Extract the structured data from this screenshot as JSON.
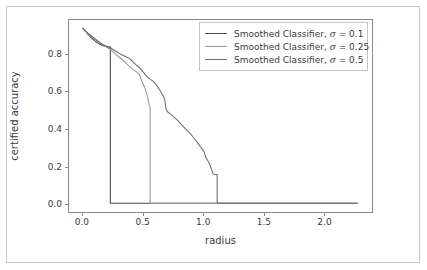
{
  "chart_data": {
    "type": "line",
    "title": "",
    "xlabel": "radius",
    "ylabel": "certified accuracy",
    "xlim": [
      -0.115,
      2.4
    ],
    "ylim": [
      -0.047,
      0.985
    ],
    "xticks": [
      0.0,
      0.5,
      1.0,
      1.5,
      2.0
    ],
    "xticklabels": [
      "0.0",
      "0.5",
      "1.0",
      "1.5",
      "2.0"
    ],
    "yticks": [
      0.0,
      0.2,
      0.4,
      0.6,
      0.8
    ],
    "yticklabels": [
      "0.0",
      "0.2",
      "0.4",
      "0.6",
      "0.8"
    ],
    "grid": false,
    "legend_position": "upper right",
    "series": [
      {
        "name": "Smoothed Classifier, σ = 0.1",
        "label_prefix": "Smoothed Classifier, ",
        "sigma_symbol": "σ",
        "sigma_value": " = 0.1",
        "color": "#4a4a4a",
        "points": [
          [
            0.0,
            0.942
          ],
          [
            0.01,
            0.932
          ],
          [
            0.02,
            0.925
          ],
          [
            0.03,
            0.918
          ],
          [
            0.04,
            0.91
          ],
          [
            0.05,
            0.902
          ],
          [
            0.06,
            0.897
          ],
          [
            0.07,
            0.89
          ],
          [
            0.08,
            0.884
          ],
          [
            0.09,
            0.879
          ],
          [
            0.1,
            0.873
          ],
          [
            0.11,
            0.868
          ],
          [
            0.12,
            0.863
          ],
          [
            0.13,
            0.859
          ],
          [
            0.14,
            0.856
          ],
          [
            0.15,
            0.852
          ],
          [
            0.16,
            0.849
          ],
          [
            0.17,
            0.847
          ],
          [
            0.18,
            0.845
          ],
          [
            0.19,
            0.843
          ],
          [
            0.2,
            0.842
          ],
          [
            0.21,
            0.841
          ],
          [
            0.22,
            0.84
          ],
          [
            0.228,
            0.84
          ],
          [
            0.228,
            0.0
          ],
          [
            2.28,
            0.0
          ]
        ]
      },
      {
        "name": "Smoothed Classifier, σ = 0.25",
        "label_prefix": "Smoothed Classifier, ",
        "sigma_symbol": "σ",
        "sigma_value": " = 0.25",
        "color": "#9a9a9a",
        "points": [
          [
            0.0,
            0.942
          ],
          [
            0.015,
            0.93
          ],
          [
            0.03,
            0.92
          ],
          [
            0.045,
            0.911
          ],
          [
            0.06,
            0.903
          ],
          [
            0.075,
            0.896
          ],
          [
            0.09,
            0.889
          ],
          [
            0.105,
            0.881
          ],
          [
            0.12,
            0.874
          ],
          [
            0.135,
            0.866
          ],
          [
            0.15,
            0.859
          ],
          [
            0.165,
            0.852
          ],
          [
            0.18,
            0.846
          ],
          [
            0.195,
            0.84
          ],
          [
            0.21,
            0.834
          ],
          [
            0.225,
            0.828
          ],
          [
            0.24,
            0.82
          ],
          [
            0.255,
            0.812
          ],
          [
            0.27,
            0.803
          ],
          [
            0.285,
            0.794
          ],
          [
            0.3,
            0.786
          ],
          [
            0.315,
            0.778
          ],
          [
            0.33,
            0.77
          ],
          [
            0.345,
            0.762
          ],
          [
            0.36,
            0.752
          ],
          [
            0.375,
            0.742
          ],
          [
            0.39,
            0.734
          ],
          [
            0.405,
            0.726
          ],
          [
            0.42,
            0.718
          ],
          [
            0.435,
            0.71
          ],
          [
            0.45,
            0.702
          ],
          [
            0.46,
            0.697
          ],
          [
            0.47,
            0.692
          ],
          [
            0.48,
            0.672
          ],
          [
            0.49,
            0.655
          ],
          [
            0.5,
            0.641
          ],
          [
            0.51,
            0.628
          ],
          [
            0.52,
            0.61
          ],
          [
            0.53,
            0.588
          ],
          [
            0.54,
            0.562
          ],
          [
            0.55,
            0.53
          ],
          [
            0.558,
            0.518
          ],
          [
            0.558,
            0.0
          ],
          [
            2.28,
            0.0
          ]
        ]
      },
      {
        "name": "Smoothed Classifier, σ = 0.5",
        "label_prefix": "Smoothed Classifier, ",
        "sigma_symbol": "σ",
        "sigma_value": " = 0.5",
        "color": "#6f6f6f",
        "points": [
          [
            0.0,
            0.942
          ],
          [
            0.02,
            0.928
          ],
          [
            0.04,
            0.916
          ],
          [
            0.06,
            0.905
          ],
          [
            0.08,
            0.895
          ],
          [
            0.1,
            0.884
          ],
          [
            0.12,
            0.874
          ],
          [
            0.14,
            0.864
          ],
          [
            0.16,
            0.856
          ],
          [
            0.18,
            0.849
          ],
          [
            0.2,
            0.843
          ],
          [
            0.22,
            0.837
          ],
          [
            0.24,
            0.83
          ],
          [
            0.26,
            0.822
          ],
          [
            0.28,
            0.814
          ],
          [
            0.3,
            0.806
          ],
          [
            0.32,
            0.799
          ],
          [
            0.34,
            0.793
          ],
          [
            0.36,
            0.787
          ],
          [
            0.38,
            0.78
          ],
          [
            0.4,
            0.77
          ],
          [
            0.42,
            0.757
          ],
          [
            0.44,
            0.745
          ],
          [
            0.46,
            0.735
          ],
          [
            0.48,
            0.722
          ],
          [
            0.5,
            0.706
          ],
          [
            0.52,
            0.69
          ],
          [
            0.54,
            0.676
          ],
          [
            0.56,
            0.666
          ],
          [
            0.58,
            0.658
          ],
          [
            0.6,
            0.645
          ],
          [
            0.62,
            0.627
          ],
          [
            0.64,
            0.607
          ],
          [
            0.65,
            0.595
          ],
          [
            0.66,
            0.585
          ],
          [
            0.67,
            0.572
          ],
          [
            0.68,
            0.556
          ],
          [
            0.69,
            0.51
          ],
          [
            0.7,
            0.494
          ],
          [
            0.71,
            0.488
          ],
          [
            0.72,
            0.483
          ],
          [
            0.74,
            0.474
          ],
          [
            0.76,
            0.462
          ],
          [
            0.78,
            0.45
          ],
          [
            0.8,
            0.436
          ],
          [
            0.82,
            0.421
          ],
          [
            0.84,
            0.408
          ],
          [
            0.86,
            0.395
          ],
          [
            0.88,
            0.382
          ],
          [
            0.9,
            0.368
          ],
          [
            0.92,
            0.352
          ],
          [
            0.94,
            0.336
          ],
          [
            0.96,
            0.318
          ],
          [
            0.98,
            0.3
          ],
          [
            1.0,
            0.283
          ],
          [
            1.01,
            0.27
          ],
          [
            1.02,
            0.248
          ],
          [
            1.03,
            0.236
          ],
          [
            1.04,
            0.226
          ],
          [
            1.05,
            0.212
          ],
          [
            1.06,
            0.196
          ],
          [
            1.07,
            0.178
          ],
          [
            1.08,
            0.158
          ],
          [
            1.09,
            0.156
          ],
          [
            1.1,
            0.155
          ],
          [
            1.115,
            0.155
          ],
          [
            1.115,
            0.0
          ],
          [
            2.28,
            0.0
          ]
        ]
      }
    ]
  },
  "axes": {
    "xlabel": "radius",
    "ylabel": "certified accuracy",
    "xticklabels": [
      "0.0",
      "0.5",
      "1.0",
      "1.5",
      "2.0"
    ],
    "yticklabels": [
      "0.0",
      "0.2",
      "0.4",
      "0.6",
      "0.8"
    ]
  },
  "legend": {
    "entries": [
      {
        "label": "Smoothed Classifier, σ = 0.1",
        "color": "#4a4a4a"
      },
      {
        "label": "Smoothed Classifier, σ = 0.25",
        "color": "#9a9a9a"
      },
      {
        "label": "Smoothed Classifier, σ = 0.5",
        "color": "#6f6f6f"
      }
    ]
  }
}
